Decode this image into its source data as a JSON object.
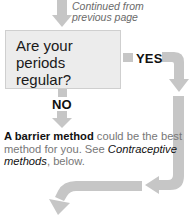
{
  "diagram": {
    "type": "flowchart",
    "continued_note": "Continued from previous page",
    "question": {
      "line1": "Are your periods",
      "line2": "regular?"
    },
    "branches": {
      "yes_label": "YES",
      "no_label": "NO"
    },
    "no_outcome": {
      "bold_lead": "A barrier method",
      "text_mid": " could be the best method for you. See ",
      "italic_ref": "Contraceptive methods",
      "text_end": ", below."
    },
    "colors": {
      "arrow": "#c6c6c6",
      "box_fill": "#ececec",
      "box_border": "#cfcfcf",
      "note_text": "#6a6a6a",
      "body_text": "#777777",
      "label_text": "#111111"
    }
  }
}
